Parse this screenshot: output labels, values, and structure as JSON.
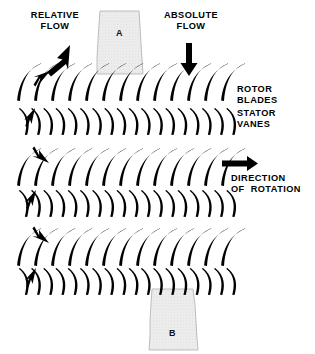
{
  "diagram": {
    "background_color": "#ffffff",
    "ink_color": "#000000",
    "duct_fill_color": "#e9e9e9",
    "duct_edge_color": "#b9b9b9"
  },
  "labels": {
    "relative_flow": "RELATIVE\nFLOW",
    "absolute_flow": "ABSOLUTE\nFLOW",
    "rotor_blades": "ROTOR\nBLADES",
    "stator_vanes": "STATOR\nVANES",
    "direction_of_rotation": "DIRECTION\nOF  ROTATION"
  },
  "ducts": [
    {
      "id": "duct-a",
      "letter": "A",
      "position": "top",
      "x": 96,
      "y": 10,
      "width": 46,
      "height": 64
    },
    {
      "id": "duct-b",
      "letter": "B",
      "position": "bottom",
      "x": 148,
      "y": 288,
      "width": 48,
      "height": 62
    }
  ],
  "arrows": {
    "relative_flow_arrow": {
      "name": "relative-flow-arrow",
      "direction": "down-left",
      "angle_deg": 228
    },
    "absolute_flow_arrow": {
      "name": "absolute-flow-arrow",
      "direction": "down",
      "angle_deg": 270
    },
    "rotation_arrow": {
      "name": "direction-of-rotation-arrow",
      "direction": "right",
      "angle_deg": 0
    },
    "passage_arrows_count": 6
  },
  "blade_rows": [
    {
      "id": "rotor-row-1",
      "type": "rotor",
      "label": "ROTOR BLADES",
      "y": 63,
      "count": 13,
      "pitch": 17.0,
      "x_start": 20,
      "length": 38,
      "lean_deg": 27
    },
    {
      "id": "stator-row-1",
      "type": "stator",
      "label": "STATOR VANES",
      "y": 108,
      "count": 18,
      "pitch": 12.2,
      "x_start": 20,
      "length": 27,
      "lean_deg": 8
    },
    {
      "id": "rotor-row-2",
      "type": "rotor",
      "label": "ROTOR BLADES",
      "y": 148,
      "count": 13,
      "pitch": 17.0,
      "x_start": 20,
      "length": 38,
      "lean_deg": 27
    },
    {
      "id": "stator-row-2",
      "type": "stator",
      "label": "STATOR VANES",
      "y": 190,
      "count": 18,
      "pitch": 12.2,
      "x_start": 20,
      "length": 27,
      "lean_deg": 8
    },
    {
      "id": "rotor-row-3",
      "type": "rotor",
      "label": "ROTOR BLADES",
      "y": 228,
      "count": 13,
      "pitch": 17.0,
      "x_start": 20,
      "length": 38,
      "lean_deg": 27
    },
    {
      "id": "stator-row-3",
      "type": "stator",
      "label": "STATOR VANES",
      "y": 268,
      "count": 18,
      "pitch": 12.2,
      "x_start": 20,
      "length": 27,
      "lean_deg": 8
    }
  ],
  "label_positions": {
    "relative_flow": {
      "x": 14,
      "y": 10
    },
    "absolute_flow": {
      "x": 152,
      "y": 10
    },
    "rotor_blades": {
      "x": 238,
      "y": 84
    },
    "stator_vanes": {
      "x": 238,
      "y": 108
    },
    "direction_of_rotation": {
      "x": 232,
      "y": 172
    }
  }
}
